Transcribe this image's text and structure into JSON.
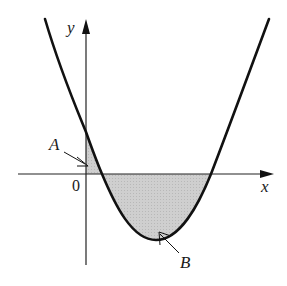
{
  "diagram": {
    "labels": {
      "x_axis": "x",
      "y_axis": "y",
      "origin": "0",
      "region_a": "A",
      "region_b": "B"
    },
    "colors": {
      "curve": "#111111",
      "axes": "#222222",
      "shading": "#c8c8c8"
    }
  }
}
